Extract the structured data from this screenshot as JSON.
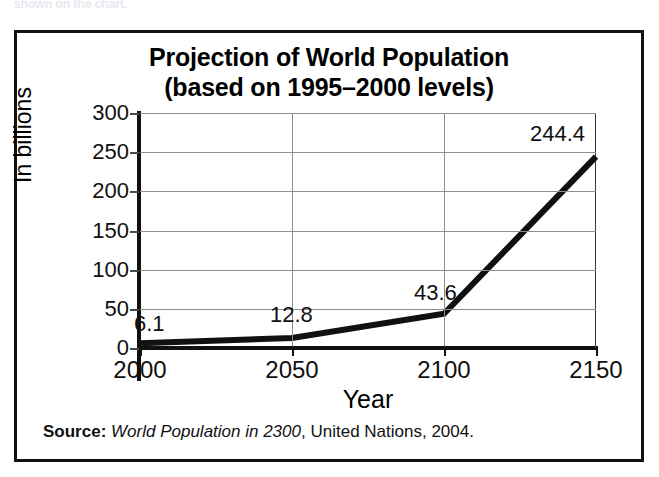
{
  "top_sliver_text": "shown on the chart.",
  "chart_data": {
    "type": "line",
    "title_line1": "Projection of World Population",
    "title_line2": "(based on 1995–2000 levels)",
    "xlabel": "Year",
    "ylabel": "In billions",
    "x": [
      2000,
      2050,
      2100,
      2150
    ],
    "xticklabels": [
      "2000",
      "2050",
      "2100",
      "2150"
    ],
    "values": [
      6.1,
      12.8,
      43.6,
      244.4
    ],
    "point_labels": [
      "6.1",
      "12.8",
      "43.6",
      "244.4"
    ],
    "yticks": [
      0,
      50,
      100,
      150,
      200,
      250,
      300
    ],
    "yticklabels": [
      "0",
      "50",
      "100",
      "150",
      "200",
      "250",
      "300"
    ],
    "ylim": [
      0,
      300
    ],
    "xlim": [
      2000,
      2150
    ],
    "grid": true,
    "legend": false,
    "series_color": "#111111",
    "grid_color": "#8e8e8e"
  },
  "source": {
    "label": "Source:",
    "title": "World Population in 2300",
    "rest": ", United Nations, 2004."
  }
}
